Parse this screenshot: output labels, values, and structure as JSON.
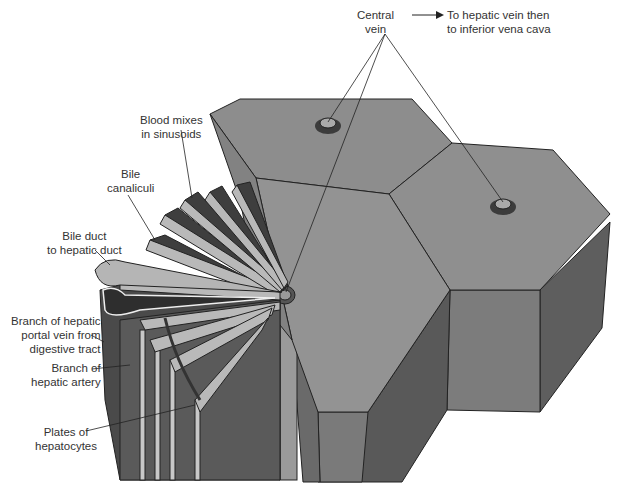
{
  "diagram": {
    "colors": {
      "background": "#ffffff",
      "lobule_top": "#8e8e8e",
      "lobule_side_light": "#7a7a7a",
      "lobule_side_dark": "#555555",
      "plate_cells": "#b8b8b8",
      "sinusoid_dark": "#3a3a3a",
      "outline": "#222222",
      "label_text": "#333333"
    },
    "labels": {
      "central_vein": {
        "line1": "Central",
        "line2": "vein"
      },
      "to_hepatic_vein": {
        "line1": "To hepatic vein then",
        "line2": "to inferior vena cava"
      },
      "blood_mixes": {
        "line1": "Blood mixes",
        "line2": "in sinusoids"
      },
      "bile_canaliculi": {
        "line1": "Bile",
        "line2": "canaliculi"
      },
      "bile_duct": {
        "line1": "Bile duct",
        "line2": "to hepatic duct"
      },
      "portal_vein": {
        "line1": "Branch of hepatic",
        "line2": "portal vein from",
        "line3": "digestive tract"
      },
      "hepatic_artery": {
        "line1": "Branch of",
        "line2": "hepatic artery"
      },
      "plates": {
        "line1": "Plates of",
        "line2": "hepatocytes"
      }
    }
  }
}
